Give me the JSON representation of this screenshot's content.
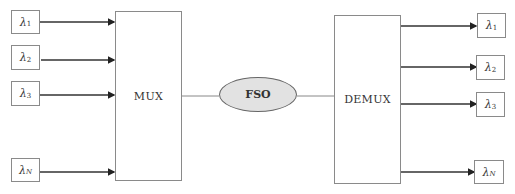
{
  "diagram": {
    "type": "WDM free-space optical link block diagram",
    "inputs": [
      {
        "symbol": "λ",
        "sub": "1"
      },
      {
        "symbol": "λ",
        "sub": "2"
      },
      {
        "symbol": "λ",
        "sub": "3"
      },
      {
        "symbol": "λ",
        "sub": "N"
      }
    ],
    "mux": {
      "label": "MUX"
    },
    "channel": {
      "label": "FSO",
      "fill": "#e2e2e2"
    },
    "demux": {
      "label": "DEMUX"
    },
    "outputs": [
      {
        "symbol": "λ",
        "sub": "1"
      },
      {
        "symbol": "λ",
        "sub": "2"
      },
      {
        "symbol": "λ",
        "sub": "3"
      },
      {
        "symbol": "λ",
        "sub": "N"
      }
    ],
    "edges": [
      [
        "λ1",
        "MUX"
      ],
      [
        "λ2",
        "MUX"
      ],
      [
        "λ3",
        "MUX"
      ],
      [
        "λN",
        "MUX"
      ],
      [
        "MUX",
        "FSO"
      ],
      [
        "FSO",
        "DEMUX"
      ],
      [
        "DEMUX",
        "λ1"
      ],
      [
        "DEMUX",
        "λ2"
      ],
      [
        "DEMUX",
        "λ3"
      ],
      [
        "DEMUX",
        "λN"
      ]
    ]
  }
}
